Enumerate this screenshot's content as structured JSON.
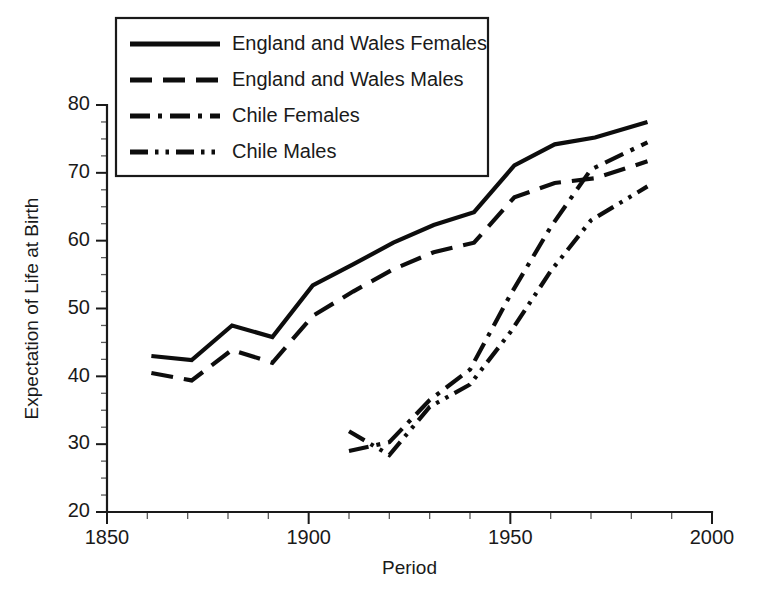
{
  "chart_data": {
    "type": "line",
    "title": "",
    "xlabel": "Period",
    "ylabel": "Expectation of Life at Birth",
    "xlim": [
      1850,
      2000
    ],
    "ylim": [
      20,
      80
    ],
    "grid": false,
    "legend_position": "top-left",
    "x_ticks": [
      1850,
      1900,
      1950,
      2000
    ],
    "x_tick_labels": [
      "1850",
      "1900",
      "1950",
      "2000"
    ],
    "x_minor_step": 10,
    "y_ticks": [
      20,
      30,
      40,
      50,
      60,
      70,
      80
    ],
    "y_tick_labels": [
      "20",
      "30",
      "40",
      "50",
      "60",
      "70",
      "80"
    ],
    "y_minor_step": 2.5,
    "series": [
      {
        "name": "England and Wales Females",
        "dash": "solid",
        "x": [
          1861,
          1871,
          1881,
          1891,
          1901,
          1911,
          1921,
          1931,
          1941,
          1951,
          1961,
          1971,
          1984
        ],
        "values": [
          43.0,
          42.4,
          47.5,
          45.8,
          53.4,
          56.5,
          59.7,
          62.3,
          64.2,
          71.1,
          74.2,
          75.2,
          77.5
        ]
      },
      {
        "name": "England and Wales Males",
        "dash": "dashed",
        "x": [
          1861,
          1871,
          1881,
          1891,
          1901,
          1911,
          1921,
          1931,
          1941,
          1951,
          1961,
          1971,
          1984
        ],
        "values": [
          40.5,
          39.4,
          43.9,
          42.0,
          48.9,
          52.5,
          55.8,
          58.3,
          59.7,
          66.4,
          68.5,
          69.2,
          71.7
        ]
      },
      {
        "name": "Chile Females",
        "dash": "dashdot",
        "x": [
          1910,
          1920,
          1930,
          1940,
          1950,
          1960,
          1970,
          1984
        ],
        "values": [
          29.0,
          30.3,
          36.5,
          41.0,
          52.0,
          62.0,
          70.5,
          74.5
        ]
      },
      {
        "name": "Chile Males",
        "dash": "dashdotdot",
        "x": [
          1910,
          1920,
          1930,
          1940,
          1950,
          1960,
          1970,
          1984
        ],
        "values": [
          31.9,
          28.4,
          35.5,
          38.8,
          46.5,
          55.5,
          63.0,
          68.0
        ]
      }
    ]
  },
  "legend": {
    "entries": [
      {
        "label": "England and Wales Females",
        "dash": "solid"
      },
      {
        "label": "England and Wales Males",
        "dash": "dashed"
      },
      {
        "label": "Chile Females",
        "dash": "dashdot"
      },
      {
        "label": "Chile Males",
        "dash": "dashdotdot"
      }
    ]
  }
}
